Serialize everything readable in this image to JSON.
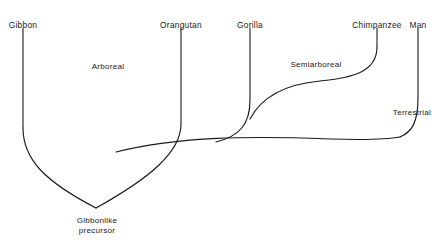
{
  "figure": {
    "type": "phylogenetic-tree",
    "background_color": "#ffffff",
    "line_color": "#1a1a1a",
    "width": 445,
    "height": 247
  },
  "tip_labels": [
    {
      "name": "gibbon",
      "text": "Gibbon",
      "x": 23,
      "y": 20
    },
    {
      "name": "orangutan",
      "text": "Orangutan",
      "x": 181,
      "y": 20
    },
    {
      "name": "gorilla",
      "text": "Gorilla",
      "x": 250,
      "y": 20
    },
    {
      "name": "chimpanzee",
      "text": "Chimpanzee",
      "x": 377,
      "y": 20
    },
    {
      "name": "man",
      "text": "Man",
      "x": 418,
      "y": 20
    }
  ],
  "zone_labels": [
    {
      "name": "arboreal",
      "text": "Arboreal",
      "x": 108,
      "y": 62
    },
    {
      "name": "semiarboreal",
      "text": "Semiarboreal",
      "x": 316,
      "y": 60
    },
    {
      "name": "terrestrial",
      "text": "Terrestrial",
      "x": 412,
      "y": 108
    }
  ],
  "root_label": {
    "name": "gibbonlike-precursor",
    "line1": "Gibbonlike",
    "line2": "precursor",
    "x": 97,
    "y": 216
  },
  "branches": [
    {
      "name": "gibbon-branch",
      "from": "Gibbon",
      "to": "Gibbonlike precursor",
      "stem": "M23,28 L23,128",
      "curve": "M23,128 C23,160 46,182 96,208"
    },
    {
      "name": "orangutan-branch",
      "from": "Orangutan",
      "to": "Gibbonlike precursor",
      "stem": "M181,28 L181,124",
      "curve": "M181,124 C181,152 150,178 96,208"
    },
    {
      "name": "trunk",
      "from": "Gibbonlike precursor junction",
      "to": "Terrestrial / Man base",
      "curve": "M116,152 C180,136 250,136 330,139 C365,140 385,140 400,137"
    },
    {
      "name": "gorilla-branch",
      "from": "Gorilla",
      "to": "trunk",
      "stem": "M250,28 L250,100",
      "curve": "M250,100 C250,124 240,136 216,142"
    },
    {
      "name": "semiarboreal-chimpanzee-branch",
      "from": "Chimpanzee",
      "to": "Gorilla junction",
      "stem": "M377,28 L377,47",
      "curve": "M377,47 C377,72 352,78 320,81 C288,84 262,96 250,119"
    },
    {
      "name": "man-branch",
      "from": "Man",
      "to": "trunk",
      "stem": "M418,28 L418,98",
      "curve": "M418,98 C418,122 412,132 400,137"
    }
  ]
}
